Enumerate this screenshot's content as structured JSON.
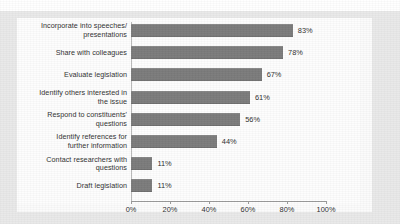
{
  "chart_data": {
    "type": "bar",
    "orientation": "horizontal",
    "title": "",
    "xlabel": "",
    "ylabel": "",
    "xlim": [
      0,
      100
    ],
    "xticks": [
      "0%",
      "20%",
      "40%",
      "60%",
      "80%",
      "100%"
    ],
    "xtick_values": [
      0,
      20,
      40,
      60,
      80,
      100
    ],
    "grid": false,
    "legend": "none",
    "bar_color": "#7b7b7b",
    "plot_background": "#fdfdfd",
    "page_background": "#e9e9e9",
    "categories": [
      "Incorporate into speeches/ presentations",
      "Share with colleagues",
      "Evaluate legislation",
      "Identify others interested in the issue",
      "Respond to constituents' questions",
      "Identify references for further information",
      "Contact researchers with questions",
      "Draft legislation"
    ],
    "category_lines": [
      [
        "Incorporate into speeches/",
        "presentations"
      ],
      [
        "Share with colleagues"
      ],
      [
        "Evaluate legislation"
      ],
      [
        "Identify others interested in",
        "the issue"
      ],
      [
        "Respond to constituents'",
        "questions"
      ],
      [
        "Identify references for",
        "further information"
      ],
      [
        "Contact researchers with",
        "questions"
      ],
      [
        "Draft legislation"
      ]
    ],
    "values": [
      83,
      78,
      67,
      61,
      56,
      44,
      11,
      11
    ],
    "value_labels": [
      "83%",
      "78%",
      "67%",
      "61%",
      "56%",
      "44%",
      "11%",
      "11%"
    ]
  }
}
